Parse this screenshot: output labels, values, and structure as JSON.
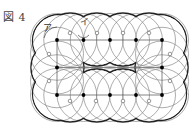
{
  "figure": {
    "label": "図 4",
    "markers": {
      "a": "ア",
      "b": "イ"
    }
  },
  "geometry": {
    "grid_x": [
      57,
      83.5,
      110,
      136,
      162
    ],
    "grid_y": [
      40,
      67.5,
      95
    ],
    "radius": 26.5,
    "stroke_bold": "#222222",
    "stroke_thin": "#777777",
    "dots": [
      [
        57,
        40
      ],
      [
        83.5,
        40
      ],
      [
        110,
        40
      ],
      [
        136,
        40
      ],
      [
        162,
        40
      ],
      [
        57,
        67.5
      ],
      [
        162,
        67.5
      ],
      [
        57,
        95
      ],
      [
        83.5,
        95
      ],
      [
        110,
        95
      ],
      [
        136,
        95
      ],
      [
        162,
        95
      ]
    ],
    "small_circles": [
      [
        70,
        33
      ],
      [
        97,
        33
      ],
      [
        123,
        33
      ],
      [
        149,
        33
      ],
      [
        49,
        54
      ],
      [
        49,
        81
      ],
      [
        170,
        54
      ],
      [
        170,
        81
      ],
      [
        70,
        101
      ],
      [
        96,
        101
      ],
      [
        123,
        101
      ],
      [
        149,
        101
      ]
    ]
  }
}
